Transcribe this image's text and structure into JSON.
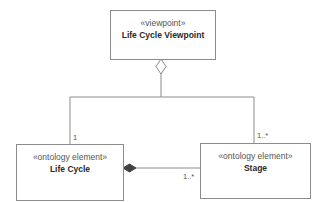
{
  "diagram": {
    "viewpoint": {
      "stereotype": "«viewpoint»",
      "name": "Life Cycle Viewpoint"
    },
    "life_cycle": {
      "stereotype": "«ontology element»",
      "name": "Life Cycle"
    },
    "stage": {
      "stereotype": "«ontology element»",
      "name": "Stage"
    },
    "multiplicities": {
      "viewpoint_to_lifecycle": "1",
      "viewpoint_to_stage": "1..*",
      "lifecycle_to_stage": "1..*"
    },
    "relationships": [
      {
        "from": "Life Cycle Viewpoint",
        "to": "Life Cycle",
        "type": "aggregation",
        "multiplicity": "1"
      },
      {
        "from": "Life Cycle Viewpoint",
        "to": "Stage",
        "type": "aggregation",
        "multiplicity": "1..*"
      },
      {
        "from": "Life Cycle",
        "to": "Stage",
        "type": "composition",
        "multiplicity": "1..*"
      }
    ],
    "colors": {
      "line": "#8c8c8c",
      "composition_fill": "#404040"
    }
  }
}
